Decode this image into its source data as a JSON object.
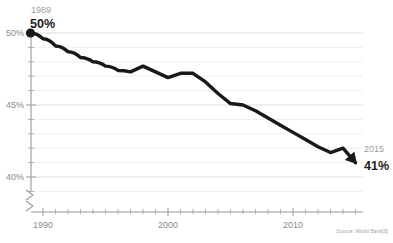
{
  "chart_data": {
    "type": "line",
    "title": "",
    "subtitle": "",
    "xlabel": "",
    "ylabel": "",
    "xlim": [
      1989,
      2015
    ],
    "ylim": [
      39.2,
      50.4
    ],
    "grid": true,
    "legend_position": "none",
    "y_unit": "%",
    "y_major_ticks": [
      "50%",
      "45%",
      "40%"
    ],
    "y_major_values": [
      50,
      45,
      40
    ],
    "y_minor_step": 1,
    "x_major_ticks": [
      "1990",
      "2000",
      "2010"
    ],
    "x_major_values": [
      1990,
      2000,
      2010
    ],
    "x_minor_step": 1,
    "axis_break": true,
    "series": [
      {
        "name": "value",
        "x": [
          1989,
          1990,
          1991,
          1992,
          1993,
          1994,
          1995,
          1996,
          1997,
          1998,
          1999,
          2000,
          2001,
          2002,
          2003,
          2004,
          2005,
          2006,
          2007,
          2008,
          2009,
          2010,
          2011,
          2012,
          2013,
          2014,
          2015
        ],
        "values": [
          50.0,
          49.6,
          49.1,
          48.7,
          48.3,
          48.0,
          47.7,
          47.4,
          47.3,
          47.7,
          47.3,
          46.9,
          47.2,
          47.2,
          46.6,
          45.8,
          45.1,
          45.0,
          44.6,
          44.1,
          43.6,
          43.1,
          42.6,
          42.1,
          41.7,
          42.0,
          41.0
        ]
      }
    ],
    "annotations": [
      {
        "name": "start-point",
        "year_label": "1989",
        "value_label": "50%",
        "x": 1989,
        "y": 50.0,
        "marker": "dot"
      },
      {
        "name": "end-point",
        "year_label": "2015",
        "value_label": "41%",
        "x": 2015,
        "y": 41.0,
        "marker": "arrow"
      }
    ],
    "source": "Source: World Bank[9]",
    "colors": {
      "line": "#191919",
      "gridline_minor": "#efefef",
      "gridline_major": "#dcdcdc",
      "axis": "#9a9a9a",
      "tick_label": "#8a8a8a",
      "annotation_year": "#9b9b9b",
      "annotation_value": "#1c1c1c",
      "background": "#ffffff",
      "source_note": "#a6a6a6"
    }
  }
}
